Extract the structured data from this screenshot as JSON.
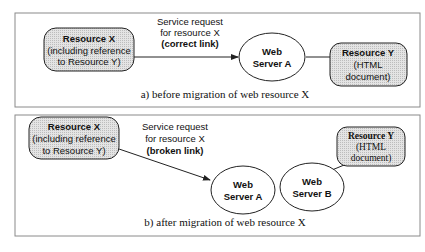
{
  "colors": {
    "panel_border": "#8a8a8a",
    "box_fill": "#d8d8d8",
    "stroke": "#222222",
    "text": "#111111"
  },
  "panel_a": {
    "caption": "a) before migration of web resource X",
    "resource_x": {
      "title": "Resource X",
      "line1": "(including reference",
      "line2": "to Resource Y)"
    },
    "request": {
      "line1": "Service request",
      "line2": "for resource X",
      "line3": "(correct link)"
    },
    "server": {
      "line1": "Web",
      "line2": "Server A"
    },
    "resource_y": {
      "title": "Resource Y",
      "line1": "(HTML",
      "line2": "document)"
    }
  },
  "panel_b": {
    "caption": "b) after migration of web resource X",
    "resource_x": {
      "title": "Resource X",
      "line1": "(including reference",
      "line2": "to Resource Y)"
    },
    "request": {
      "line1": "Service request",
      "line2": "for resource X",
      "line3": "(broken link)"
    },
    "server_a": {
      "line1": "Web",
      "line2": "Server A"
    },
    "server_b": {
      "line1": "Web",
      "line2": "Server B"
    },
    "resource_y": {
      "title": "Resource Y",
      "line1": "(HTML",
      "line2": "document)"
    }
  }
}
